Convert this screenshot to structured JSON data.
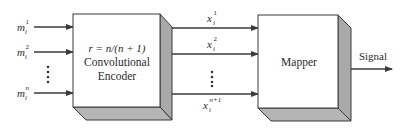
{
  "diagram": {
    "type": "block-diagram",
    "colors": {
      "stroke": "#3a3a3a",
      "box_front": "#ffffff",
      "box_side": "#a9a9a9",
      "box_bottom": "#b5b5b5",
      "text": "#2a2a2a"
    },
    "inputs": [
      {
        "base": "m",
        "sub": "i",
        "sup": "1"
      },
      {
        "base": "m",
        "sub": "i",
        "sup": "2"
      },
      {
        "base": "m",
        "sub": "i",
        "sup": "n"
      }
    ],
    "encoder": {
      "rate_label": "r = n/(n + 1)",
      "line1": "Convolutional",
      "line2": "Encoder"
    },
    "intermediate": [
      {
        "base": "x",
        "sub": "i",
        "sup": "1"
      },
      {
        "base": "x",
        "sub": "i",
        "sup": "2"
      },
      {
        "base": "x",
        "sub": "i",
        "sup": "n+1"
      }
    ],
    "mapper": {
      "label": "Mapper"
    },
    "output": {
      "label": "Signal"
    },
    "ellipsis": "⋮"
  }
}
